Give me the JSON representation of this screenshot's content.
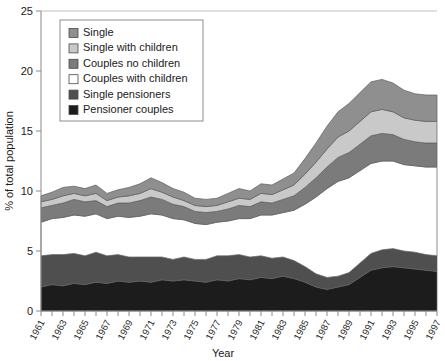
{
  "chart_data": {
    "type": "area",
    "stacked": true,
    "title": "",
    "xlabel": "Year",
    "ylabel": "% of total population",
    "ylim": [
      0,
      25
    ],
    "yticks": [
      0,
      5,
      10,
      15,
      20,
      25
    ],
    "ytick_labels": [
      "0",
      "5",
      "10",
      "15",
      "20",
      "25"
    ],
    "xlim": [
      1961,
      1997
    ],
    "grid": false,
    "legend_position": "top-left-inside",
    "x": [
      1961,
      1962,
      1963,
      1964,
      1965,
      1966,
      1967,
      1968,
      1969,
      1970,
      1971,
      1972,
      1973,
      1974,
      1975,
      1976,
      1977,
      1978,
      1979,
      1980,
      1981,
      1982,
      1983,
      1984,
      1985,
      1986,
      1987,
      1988,
      1989,
      1990,
      1991,
      1992,
      1993,
      1994,
      1995,
      1996,
      1997
    ],
    "xtick_labels": [
      "1961",
      "1963",
      "1965",
      "1967",
      "1969",
      "1971",
      "1973",
      "1975",
      "1977",
      "1979",
      "1981",
      "1983",
      "1985",
      "1987",
      "1989",
      "1991",
      "1993",
      "1995",
      "1997"
    ],
    "stack_order_bottom_to_top": [
      "Pensioner couples",
      "Single pensioners",
      "Couples with children",
      "Couples no children",
      "Single with children",
      "Single"
    ],
    "series": [
      {
        "name": "Pensioner couples",
        "color": "#1c1c1c",
        "values": [
          2.0,
          2.2,
          2.1,
          2.3,
          2.2,
          2.4,
          2.3,
          2.5,
          2.4,
          2.5,
          2.4,
          2.6,
          2.5,
          2.6,
          2.5,
          2.4,
          2.6,
          2.5,
          2.7,
          2.6,
          2.8,
          2.7,
          2.9,
          2.7,
          2.4,
          2.0,
          1.8,
          2.0,
          2.2,
          2.8,
          3.4,
          3.6,
          3.7,
          3.6,
          3.5,
          3.4,
          3.3
        ]
      },
      {
        "name": "Single pensioners",
        "color": "#4f4f4f",
        "values": [
          2.6,
          2.5,
          2.6,
          2.5,
          2.4,
          2.5,
          2.3,
          2.2,
          2.1,
          2.0,
          2.1,
          1.9,
          1.8,
          1.9,
          1.8,
          1.9,
          2.0,
          2.1,
          2.0,
          1.9,
          1.8,
          1.7,
          1.6,
          1.5,
          1.3,
          1.1,
          1.0,
          0.9,
          1.0,
          1.2,
          1.4,
          1.5,
          1.5,
          1.4,
          1.4,
          1.3,
          1.3
        ]
      },
      {
        "name": "Couples with children",
        "color": "#ffffff",
        "values": [
          2.8,
          3.0,
          3.1,
          3.2,
          3.3,
          3.2,
          3.1,
          3.2,
          3.3,
          3.4,
          3.6,
          3.5,
          3.4,
          3.1,
          3.0,
          2.9,
          2.8,
          2.9,
          3.0,
          3.2,
          3.4,
          3.6,
          3.7,
          4.2,
          5.2,
          6.4,
          7.4,
          7.9,
          7.9,
          7.7,
          7.5,
          7.4,
          7.3,
          7.2,
          7.2,
          7.3,
          7.4
        ]
      },
      {
        "name": "Couples no children",
        "color": "#7b7b7b",
        "values": [
          1.2,
          1.1,
          1.2,
          1.3,
          1.2,
          1.1,
          1.0,
          1.1,
          1.2,
          1.3,
          1.4,
          1.3,
          1.2,
          1.1,
          1.0,
          1.0,
          0.9,
          1.0,
          1.1,
          1.0,
          1.1,
          1.0,
          1.1,
          1.2,
          1.4,
          1.6,
          1.8,
          2.0,
          2.1,
          2.2,
          2.3,
          2.3,
          2.2,
          2.1,
          2.0,
          2.0,
          2.0
        ]
      },
      {
        "name": "Single with children",
        "color": "#c9c9c9",
        "values": [
          0.5,
          0.5,
          0.6,
          0.5,
          0.5,
          0.6,
          0.5,
          0.5,
          0.6,
          0.6,
          0.7,
          0.6,
          0.6,
          0.5,
          0.5,
          0.5,
          0.5,
          0.6,
          0.6,
          0.6,
          0.7,
          0.7,
          0.8,
          0.9,
          1.1,
          1.3,
          1.5,
          1.7,
          1.8,
          1.9,
          2.0,
          2.0,
          1.9,
          1.8,
          1.8,
          1.8,
          1.8
        ]
      },
      {
        "name": "Single",
        "color": "#8f8f8f",
        "values": [
          0.5,
          0.6,
          0.7,
          0.6,
          0.6,
          0.7,
          0.6,
          0.6,
          0.7,
          0.8,
          0.9,
          0.8,
          0.7,
          0.7,
          0.6,
          0.6,
          0.6,
          0.7,
          0.8,
          0.7,
          0.8,
          0.8,
          0.9,
          1.0,
          1.3,
          1.6,
          1.9,
          2.1,
          2.3,
          2.4,
          2.5,
          2.5,
          2.4,
          2.3,
          2.2,
          2.2,
          2.2
        ]
      }
    ]
  },
  "legend": {
    "items": [
      {
        "label": "Single",
        "color": "#8f8f8f"
      },
      {
        "label": "Single with children",
        "color": "#c9c9c9"
      },
      {
        "label": "Couples no children",
        "color": "#7b7b7b"
      },
      {
        "label": "Couples with children",
        "color": "#ffffff"
      },
      {
        "label": "Single pensioners",
        "color": "#4f4f4f"
      },
      {
        "label": "Pensioner couples",
        "color": "#1c1c1c"
      }
    ]
  }
}
